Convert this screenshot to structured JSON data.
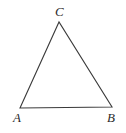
{
  "figure": {
    "name": "triangle-diagram",
    "type": "geometry-figure",
    "background_color": "#ffffff",
    "stroke_color": "#3a3a3a",
    "stroke_width": 1.1,
    "label_color": "#2b2b2b",
    "width": 126,
    "height": 133,
    "vertices": [
      {
        "id": "A",
        "label": "A",
        "x": 20,
        "y": 108,
        "label_x": 13,
        "label_y": 111,
        "position": "bottom-left"
      },
      {
        "id": "B",
        "label": "B",
        "x": 112,
        "y": 107,
        "label_x": 107,
        "label_y": 111,
        "position": "bottom-right"
      },
      {
        "id": "C",
        "label": "C",
        "x": 59,
        "y": 22,
        "label_x": 55,
        "label_y": 5,
        "position": "apex"
      }
    ],
    "edges": [
      {
        "id": "AC",
        "from": "A",
        "to": "C"
      },
      {
        "id": "CB",
        "from": "C",
        "to": "B"
      },
      {
        "id": "AB",
        "from": "A",
        "to": "B"
      }
    ],
    "polygon_points": "20,108 59,22 112,107"
  }
}
